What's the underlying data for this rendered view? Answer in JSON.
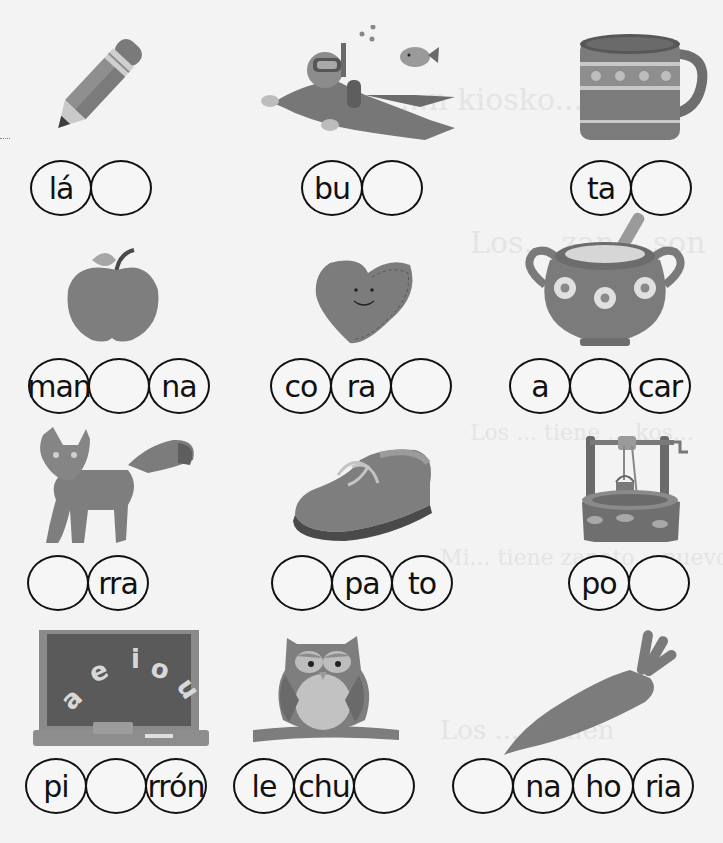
{
  "worksheet": {
    "background_ghost_text": [
      "...n kiosko...",
      "Los... zan... son",
      "...",
      "Los ... tiene ... kos...",
      "Mi... tiene zapato... nuevo",
      "Los ... comen",
      "...mitas"
    ],
    "items": [
      {
        "id": "lapiz",
        "picture": "pencil",
        "syllables": [
          "lá",
          "",
          ""
        ],
        "visible_circles": 2
      },
      {
        "id": "buzo",
        "picture": "scuba-diver",
        "syllables": [
          "bu",
          ""
        ],
        "visible_circles": 2
      },
      {
        "id": "taza",
        "picture": "mug",
        "syllables": [
          "ta",
          ""
        ],
        "visible_circles": 2
      },
      {
        "id": "manzana",
        "picture": "apple",
        "syllables": [
          "man",
          "",
          "na"
        ]
      },
      {
        "id": "corazon",
        "picture": "heart",
        "syllables": [
          "co",
          "ra",
          ""
        ]
      },
      {
        "id": "azucarero",
        "picture": "sugar-bowl",
        "syllables": [
          "a",
          "",
          "car"
        ]
      },
      {
        "id": "zorra",
        "picture": "fox",
        "syllables": [
          "",
          "rra"
        ]
      },
      {
        "id": "zapato",
        "picture": "shoe",
        "syllables": [
          "",
          "pa",
          "to"
        ]
      },
      {
        "id": "pozo",
        "picture": "well",
        "syllables": [
          "po",
          ""
        ]
      },
      {
        "id": "pizarron",
        "picture": "chalkboard",
        "syllables": [
          "pi",
          "",
          "rrón"
        ],
        "chalkboard_letters": [
          "a",
          "e",
          "i",
          "o",
          "u"
        ]
      },
      {
        "id": "lechuza",
        "picture": "owl",
        "syllables": [
          "le",
          "chu",
          ""
        ]
      },
      {
        "id": "zanahoria",
        "picture": "carrot",
        "syllables": [
          "",
          "na",
          "ho",
          "ria"
        ]
      }
    ]
  },
  "layout": {
    "chains": [
      {
        "x": 30,
        "y": 160,
        "n": 2
      },
      {
        "x": 301,
        "y": 160,
        "n": 2
      },
      {
        "x": 570,
        "y": 160,
        "n": 2
      },
      {
        "x": 28,
        "y": 358,
        "n": 3
      },
      {
        "x": 270,
        "y": 358,
        "n": 3
      },
      {
        "x": 509,
        "y": 358,
        "n": 3
      },
      {
        "x": 27,
        "y": 555,
        "n": 2
      },
      {
        "x": 271,
        "y": 555,
        "n": 3
      },
      {
        "x": 568,
        "y": 555,
        "n": 2
      },
      {
        "x": 25,
        "y": 758,
        "n": 3
      },
      {
        "x": 233,
        "y": 758,
        "n": 3
      },
      {
        "x": 452,
        "y": 758,
        "n": 4
      }
    ]
  },
  "colors": {
    "ink": "#111111",
    "paper": "#f3f3f3",
    "art_dark": "#6e6e6e",
    "art_mid": "#8c8c8c",
    "art_light": "#bdbdbd"
  }
}
